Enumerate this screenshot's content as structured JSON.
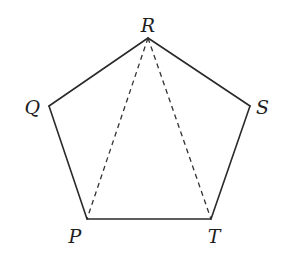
{
  "figure": {
    "type": "geometry",
    "shape": "regular pentagon",
    "vertices": [
      {
        "name": "R",
        "x": 148,
        "y": 38,
        "label_x": 148,
        "label_y": 32,
        "anchor": "middle"
      },
      {
        "name": "S",
        "x": 250,
        "y": 106,
        "label_x": 256,
        "label_y": 114,
        "anchor": "start"
      },
      {
        "name": "T",
        "x": 211,
        "y": 219,
        "label_x": 214,
        "label_y": 243,
        "anchor": "middle"
      },
      {
        "name": "P",
        "x": 87,
        "y": 219,
        "label_x": 75,
        "label_y": 243,
        "anchor": "middle"
      },
      {
        "name": "Q",
        "x": 49,
        "y": 106,
        "label_x": 40,
        "label_y": 114,
        "anchor": "end"
      }
    ],
    "edges": [
      {
        "from": "R",
        "to": "S",
        "style": "solid"
      },
      {
        "from": "S",
        "to": "T",
        "style": "solid"
      },
      {
        "from": "T",
        "to": "P",
        "style": "solid"
      },
      {
        "from": "P",
        "to": "Q",
        "style": "solid"
      },
      {
        "from": "Q",
        "to": "R",
        "style": "solid"
      }
    ],
    "diagonals": [
      {
        "from": "R",
        "to": "P",
        "style": "dashed"
      },
      {
        "from": "R",
        "to": "T",
        "style": "dashed"
      }
    ],
    "colors": {
      "line": "#2a2a2a",
      "label": "#1e1e1e",
      "background": "#ffffff"
    }
  }
}
